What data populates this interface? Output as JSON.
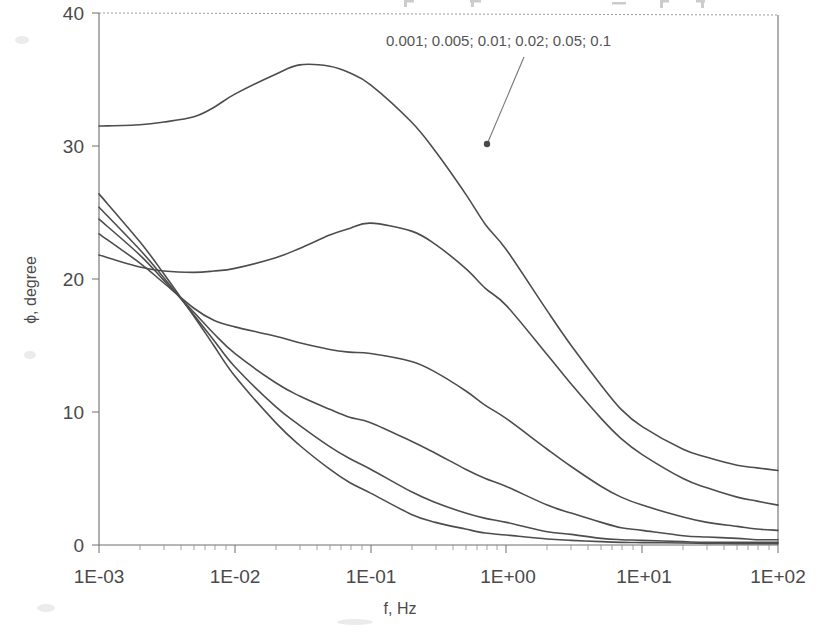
{
  "figure": {
    "background_color": "#ffffff",
    "curve_color": "#4d4d4d",
    "axis_color": "#6e6e6e",
    "text_color": "#4a4a4a"
  },
  "axes": {
    "x_axis_title": "f, Hz",
    "y_axis_title": "ϕ, degree",
    "x_tick_labels": [
      "1E-03",
      "1E-02",
      "1E-01",
      "1E+00",
      "1E+01",
      "1E+02"
    ],
    "y_tick_labels": [
      "0",
      "10",
      "20",
      "30",
      "40"
    ]
  },
  "annotation": {
    "series_list_label": "0.001; 0.005; 0.01; 0.02; 0.05; 0.1"
  },
  "chart_data": {
    "type": "line",
    "title": "",
    "subtitle": "",
    "xlabel": "f, Hz",
    "ylabel": "ϕ, degree",
    "xscale": "log",
    "yscale": "linear",
    "xlim": [
      0.001,
      100
    ],
    "ylim": [
      0,
      40
    ],
    "xticks": [
      0.001,
      0.01,
      0.1,
      1,
      10,
      100
    ],
    "xtick_labels": [
      "1E-03",
      "1E-02",
      "1E-01",
      "1E+00",
      "1E+01",
      "1E+02"
    ],
    "yticks": [
      0,
      10,
      20,
      30,
      40
    ],
    "ytick_labels": [
      "0",
      "10",
      "20",
      "30",
      "40"
    ],
    "grid": false,
    "legend": "none",
    "annotations": [
      {
        "text": "0.001; 0.005; 0.01; 0.02; 0.05; 0.1",
        "x_px": 386,
        "y_px": 46,
        "arrow_from_px": [
          524,
          57
        ],
        "arrow_to_px": [
          487,
          144
        ]
      }
    ],
    "x": [
      0.001,
      0.002,
      0.003,
      0.005,
      0.007,
      0.01,
      0.02,
      0.03,
      0.05,
      0.07,
      0.1,
      0.2,
      0.3,
      0.5,
      0.7,
      1,
      2,
      3,
      5,
      7,
      10,
      20,
      30,
      50,
      70,
      100
    ],
    "series": [
      {
        "name": "0.001",
        "values": [
          31.5,
          31.6,
          31.8,
          32.2,
          32.9,
          33.9,
          35.4,
          36.1,
          36.0,
          35.5,
          34.6,
          31.8,
          29.6,
          26.4,
          24.1,
          22.2,
          17.6,
          15.0,
          12.0,
          10.2,
          8.9,
          7.2,
          6.6,
          6.0,
          5.8,
          5.6
        ]
      },
      {
        "name": "0.005",
        "values": [
          21.8,
          20.9,
          20.6,
          20.5,
          20.6,
          20.8,
          21.6,
          22.3,
          23.3,
          23.8,
          24.2,
          23.6,
          22.6,
          20.8,
          19.3,
          18.0,
          14.3,
          12.1,
          9.5,
          8.0,
          6.8,
          5.0,
          4.3,
          3.6,
          3.3,
          3.0
        ]
      },
      {
        "name": "0.01",
        "values": [
          23.4,
          21.2,
          19.7,
          17.8,
          16.9,
          16.4,
          15.7,
          15.2,
          14.7,
          14.5,
          14.4,
          13.8,
          13.0,
          11.6,
          10.5,
          9.5,
          7.2,
          5.9,
          4.4,
          3.6,
          3.0,
          2.1,
          1.7,
          1.4,
          1.2,
          1.1
        ]
      },
      {
        "name": "0.02",
        "values": [
          24.5,
          21.8,
          19.9,
          17.5,
          15.9,
          14.4,
          12.2,
          11.2,
          10.2,
          9.6,
          9.2,
          7.8,
          6.9,
          5.7,
          5.0,
          4.4,
          3.0,
          2.4,
          1.7,
          1.3,
          1.1,
          0.7,
          0.6,
          0.5,
          0.4,
          0.4
        ]
      },
      {
        "name": "0.05",
        "values": [
          25.4,
          22.2,
          20.1,
          17.3,
          15.4,
          13.4,
          10.4,
          9.0,
          7.4,
          6.5,
          5.7,
          4.0,
          3.2,
          2.4,
          2.0,
          1.7,
          1.0,
          0.8,
          0.5,
          0.4,
          0.35,
          0.25,
          0.2,
          0.2,
          0.2,
          0.2
        ]
      },
      {
        "name": "0.1",
        "values": [
          26.4,
          22.8,
          20.4,
          17.2,
          15.0,
          12.7,
          9.2,
          7.5,
          5.7,
          4.7,
          3.9,
          2.3,
          1.7,
          1.2,
          0.9,
          0.75,
          0.45,
          0.35,
          0.25,
          0.2,
          0.18,
          0.15,
          0.12,
          0.1,
          0.1,
          0.1
        ]
      }
    ]
  },
  "plot_geometry": {
    "left_px": 99,
    "right_px": 778,
    "top_px": 13,
    "bottom_px": 545
  }
}
